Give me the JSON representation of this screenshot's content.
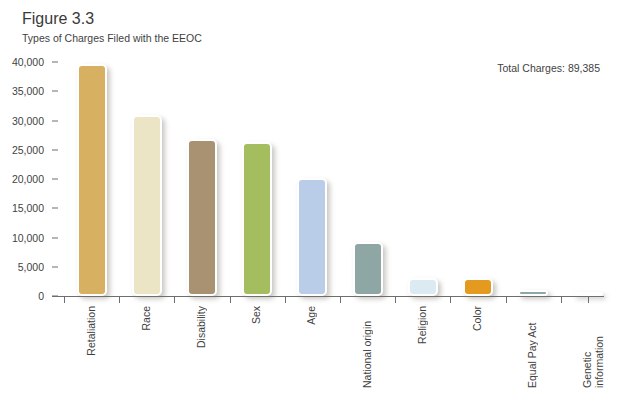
{
  "header": {
    "figure_number": "Figure 3.3",
    "figure_title": "Types of Charges Filed with the EEOC"
  },
  "annotation": {
    "total_charges": "Total Charges: 89,385"
  },
  "chart_data": {
    "type": "bar",
    "title": "Types of Charges Filed with the EEOC",
    "xlabel": "",
    "ylabel": "",
    "ylim": [
      0,
      40000
    ],
    "grid": false,
    "legend": "none",
    "ytick_labels": [
      "40,000",
      "35,000",
      "30,000",
      "25,000",
      "20,000",
      "15,000",
      "10,000",
      "5,000",
      "0"
    ],
    "ytick_values": [
      40000,
      35000,
      30000,
      25000,
      20000,
      15000,
      10000,
      5000,
      0
    ],
    "categories": [
      "Retaliation",
      "Race",
      "Disability",
      "Sex",
      "Age",
      "National origin",
      "Religion",
      "Color",
      "Equal Pay Act",
      "Genetic information"
    ],
    "values": [
      39600,
      31000,
      26900,
      26300,
      20100,
      9300,
      3000,
      3100,
      1000,
      200
    ],
    "colors": [
      "#d8b062",
      "#ece5c5",
      "#a99272",
      "#a3bd5f",
      "#b9cce8",
      "#8ea6a4",
      "#dceaf2",
      "#e49a1f",
      "#8ea6a4",
      "#dfe6e6"
    ],
    "total_charges": 89385,
    "annotations": [
      "Total Charges: 89,385"
    ]
  }
}
